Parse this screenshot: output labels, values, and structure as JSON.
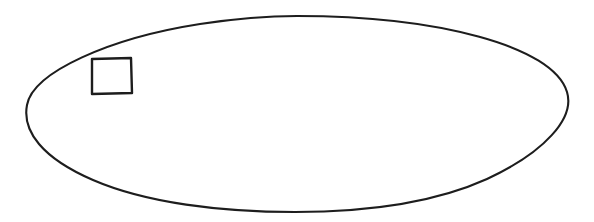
{
  "document": {
    "title": "Ellipse with inscribed square",
    "background_color": "#ffffff",
    "width": 594,
    "height": 222
  },
  "figure": {
    "name": "line-drawing",
    "description": "Hand-drawn black outline of a wide horizontal ellipse containing a small square near its upper-left interior",
    "ink_color": "#1d1d1d",
    "shapes": [
      {
        "id": "ellipse",
        "type": "ellipse",
        "label": "ellipse-outline",
        "filled": false,
        "stroke_color": "#1d1d1d",
        "stroke_width": 2.1,
        "center_x": 297,
        "center_y": 114,
        "radius_x": 272,
        "radius_y": 98,
        "bounds": {
          "left": 25,
          "top": 16,
          "right": 569,
          "bottom": 212
        }
      },
      {
        "id": "square",
        "type": "rectangle",
        "label": "square-outline",
        "filled": false,
        "stroke_color": "#1d1d1d",
        "stroke_width": 2.4,
        "x": 91,
        "y": 58,
        "width": 41,
        "height": 36,
        "bounds": {
          "left": 91,
          "top": 58,
          "right": 132,
          "bottom": 94
        }
      }
    ]
  }
}
